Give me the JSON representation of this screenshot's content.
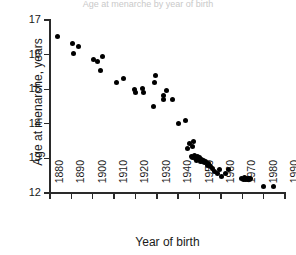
{
  "chart_data": {
    "type": "scatter",
    "title": "Age at menarche by year of birth",
    "xlabel": "Year of birth",
    "ylabel": "Age at menarche, years",
    "xlim": [
      1880,
      1990
    ],
    "ylim": [
      12,
      17
    ],
    "xticks": [
      1880,
      1890,
      1900,
      1910,
      1920,
      1930,
      1940,
      1950,
      1960,
      1970,
      1980,
      1990
    ],
    "xtick_labels": [
      "1880",
      "1890",
      "1900",
      "1910",
      "1920",
      "1930",
      "1940",
      "1950",
      "1960",
      "1970",
      "1980",
      "1990"
    ],
    "yticks": [
      12,
      13,
      14,
      15,
      16,
      17
    ],
    "ytick_labels": [
      "12",
      "13",
      "14",
      "15",
      "16",
      "17"
    ],
    "grid": false,
    "legend": false,
    "marker": "filled-circle",
    "marker_color": "#000000",
    "series": [
      {
        "name": "Age at menarche",
        "points": [
          [
            1883.5,
            16.52
          ],
          [
            1890.5,
            16.31
          ],
          [
            1891.0,
            16.02
          ],
          [
            1893.5,
            16.22
          ],
          [
            1900.5,
            15.87
          ],
          [
            1902.0,
            15.8
          ],
          [
            1904.5,
            15.95
          ],
          [
            1903.5,
            15.55
          ],
          [
            1911.0,
            15.2
          ],
          [
            1914.5,
            15.3
          ],
          [
            1919.5,
            15.0
          ],
          [
            1919.8,
            14.9
          ],
          [
            1923.5,
            15.03
          ],
          [
            1923.8,
            14.9
          ],
          [
            1929.5,
            15.4
          ],
          [
            1929.0,
            15.2
          ],
          [
            1928.5,
            14.5
          ],
          [
            1933.0,
            14.82
          ],
          [
            1933.2,
            14.7
          ],
          [
            1934.5,
            14.95
          ],
          [
            1937.5,
            14.7
          ],
          [
            1940.0,
            14.0
          ],
          [
            1943.5,
            14.1
          ],
          [
            1944.5,
            13.3
          ],
          [
            1945.5,
            13.42
          ],
          [
            1947.0,
            13.5
          ],
          [
            1946.5,
            13.33
          ],
          [
            1946.0,
            13.05
          ],
          [
            1946.8,
            13.02
          ],
          [
            1947.5,
            13.08
          ],
          [
            1948.0,
            13.0
          ],
          [
            1948.5,
            12.95
          ],
          [
            1949.0,
            13.05
          ],
          [
            1949.5,
            12.98
          ],
          [
            1950.0,
            13.02
          ],
          [
            1950.5,
            12.92
          ],
          [
            1951.0,
            12.98
          ],
          [
            1951.5,
            12.9
          ],
          [
            1952.0,
            12.95
          ],
          [
            1952.5,
            12.88
          ],
          [
            1953.0,
            12.92
          ],
          [
            1953.5,
            12.8
          ],
          [
            1954.0,
            12.85
          ],
          [
            1955.0,
            12.78
          ],
          [
            1956.0,
            12.72
          ],
          [
            1957.0,
            12.62
          ],
          [
            1958.5,
            12.55
          ],
          [
            1959.5,
            12.68
          ],
          [
            1960.5,
            12.48
          ],
          [
            1962.0,
            12.55
          ],
          [
            1963.5,
            12.68
          ],
          [
            1969.5,
            12.42
          ],
          [
            1970.5,
            12.4
          ],
          [
            1971.0,
            12.44
          ],
          [
            1971.5,
            12.38
          ],
          [
            1972.0,
            12.42
          ],
          [
            1972.5,
            12.4
          ],
          [
            1973.0,
            12.43
          ],
          [
            1973.5,
            12.38
          ],
          [
            1974.0,
            12.42
          ],
          [
            1980.0,
            12.2
          ],
          [
            1984.5,
            12.2
          ]
        ]
      }
    ]
  }
}
